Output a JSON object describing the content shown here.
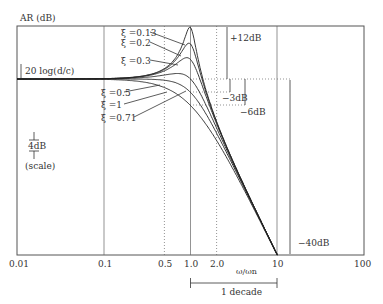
{
  "chart_data": {
    "type": "line",
    "title": "",
    "xlabel": "ω/ωn",
    "ylabel": "AR (dB)",
    "x_scale": "log",
    "xlim": [
      0.01,
      100
    ],
    "x_ticks": [
      "0.01",
      "0.1",
      "0.5",
      "1.0",
      "2.0",
      "10",
      "100"
    ],
    "ylim_db_relative": [
      -40,
      12
    ],
    "grid": "vertical lines at 0.1, 1.0, 10 (solid) and 0.5, 2.0 (dotted)",
    "series": [
      {
        "name": "ξ = 0.13",
        "zeta": 0.13
      },
      {
        "name": "ξ = 0.2",
        "zeta": 0.2
      },
      {
        "name": "ξ = 0.3",
        "zeta": 0.3
      },
      {
        "name": "ξ = 0.5",
        "zeta": 0.5
      },
      {
        "name": "ξ = 1",
        "zeta": 1
      },
      {
        "name": "ξ = 0.71",
        "zeta": 0.71
      }
    ],
    "annotations": {
      "baseline": "20 log(d/c)",
      "peak": "+12dB",
      "minus3": "−3dB",
      "minus6": "−6dB",
      "minus40": "−40dB",
      "scale_bar": "4dB",
      "scale_label": "(scale)",
      "decade": "1 decade"
    }
  },
  "labels": {
    "ylabel": "AR (dB)",
    "xlabel": "ω/ωn",
    "baseline": "20 log(d/c)",
    "peak": "+12dB",
    "m3": "−3dB",
    "m6": "−6dB",
    "m40": "−40dB",
    "scale_bar": "4dB",
    "scale_label": "(scale)",
    "decade": "1 decade",
    "z013": "ξ =0.13",
    "z02": "ξ =0.2",
    "z03": "ξ =0.3",
    "z05": "ξ =0.5",
    "z1": "ξ =1",
    "z071": "ξ =0.71",
    "x001": "0.01",
    "x01": "0.1",
    "x05": "0.5",
    "x1": "1.0",
    "x2": "2.0",
    "x10": "10",
    "x100": "100"
  }
}
